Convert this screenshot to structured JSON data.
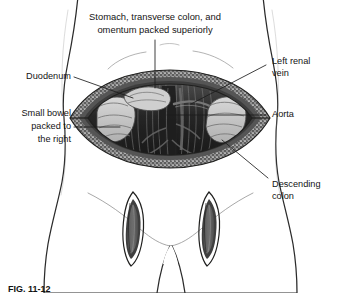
{
  "figure": {
    "background_color": "#ffffff",
    "skin_fill": "#ededed",
    "skin_shadow": "#dcdcdc",
    "outline_color": "#2b2b2b",
    "incision_dark": "#3a3a3a",
    "cavity_dark": "#242424",
    "fat_speckle": "#f2f2f2",
    "bowel_fill": "#c9c9c9",
    "label_color": "#141414",
    "leader_color": "#1d1d1d"
  },
  "labels": [
    {
      "id": "stomach-colon-omentum",
      "name": "label-stomach-transverse-colon-omentum",
      "line1": "Stomach, transverse colon, and",
      "line2": "omentum packed superiorly",
      "position": "top-center",
      "anchor": "middle"
    },
    {
      "id": "duodenum",
      "name": "label-duodenum",
      "line1": "Duodenum",
      "line2": "",
      "position": "left-upper",
      "anchor": "end"
    },
    {
      "id": "small-bowel",
      "name": "label-small-bowel-packed-right",
      "line1": "Small bowel",
      "line2": "packed to",
      "line3": "the right",
      "position": "left-middle",
      "anchor": "end"
    },
    {
      "id": "left-renal-vein",
      "name": "label-left-renal-vein",
      "line1": "Left renal",
      "line2": "vein",
      "position": "right-upper",
      "anchor": "start"
    },
    {
      "id": "aorta",
      "name": "label-aorta",
      "line1": "Aorta",
      "line2": "",
      "position": "right-middle",
      "anchor": "start"
    },
    {
      "id": "descending-colon",
      "name": "label-descending-colon",
      "line1": "Descending",
      "line2": "colon",
      "position": "right-lower",
      "anchor": "start"
    }
  ],
  "anatomy": {
    "abdominal_incision": "transverse chevron-shaped laparotomy incision, retracted open",
    "groin_incision_left": "vertical lens-shaped left groin incision",
    "groin_incision_right": "vertical lens-shaped right groin incision",
    "cavity": "retroperitoneal space with great vessels exposed"
  },
  "caption": {
    "figure_number": "FIG. 11-12",
    "text": ""
  }
}
